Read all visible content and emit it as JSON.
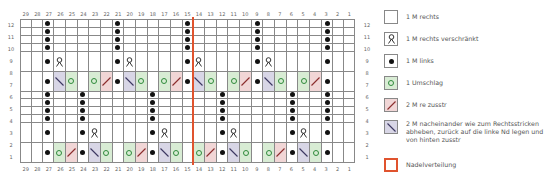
{
  "chart": {
    "columns": [
      29,
      28,
      27,
      26,
      25,
      24,
      23,
      22,
      21,
      20,
      19,
      18,
      17,
      16,
      15,
      14,
      13,
      12,
      11,
      10,
      9,
      8,
      7,
      6,
      5,
      4,
      3,
      2,
      1
    ],
    "rows": [
      12,
      11,
      10,
      9,
      8,
      7,
      6,
      5,
      4,
      3,
      2,
      1
    ],
    "needle_division_between_columns": [
      15,
      14
    ],
    "symbol_legend": {
      "k": "empty",
      "q": "twisted-knit",
      "p": "dot",
      "yo": "ring",
      "k2tog": "slash-right",
      "ssk": "slash-left"
    },
    "cells": {
      "12": {
        "27": "p",
        "21": "p",
        "15": "p",
        "9": "p",
        "3": "p"
      },
      "11": {
        "27": "p",
        "21": "p",
        "15": "p",
        "9": "p",
        "3": "p"
      },
      "10": {
        "27": "p",
        "21": "p",
        "15": "p",
        "9": "p",
        "3": "p"
      },
      "9": {
        "27": "p",
        "21": "p",
        "15": "p",
        "9": "p",
        "3": "p"
      },
      "8": {
        "27": "p",
        "26": "q",
        "21": "p",
        "20": "q",
        "15": "p",
        "14": "q",
        "9": "p",
        "8": "q",
        "3": "p"
      },
      "7": {
        "27": "p",
        "26": "ssk",
        "25": "yo",
        "23": "yo",
        "22": "k2tog",
        "21": "p",
        "20": "ssk",
        "19": "yo",
        "17": "yo",
        "16": "k2tog",
        "15": "p",
        "14": "ssk",
        "13": "yo",
        "11": "yo",
        "10": "k2tog",
        "9": "p",
        "8": "ssk",
        "7": "yo",
        "5": "yo",
        "4": "k2tog",
        "3": "p"
      },
      "6": {
        "27": "p",
        "24": "p",
        "18": "p",
        "12": "p",
        "6": "p",
        "3": "p"
      },
      "5": {
        "27": "p",
        "24": "p",
        "18": "p",
        "12": "p",
        "6": "p",
        "3": "p"
      },
      "4": {
        "27": "p",
        "24": "p",
        "18": "p",
        "12": "p",
        "6": "p",
        "3": "p"
      },
      "3": {
        "27": "p",
        "24": "p",
        "18": "p",
        "12": "p",
        "6": "p",
        "3": "p"
      },
      "2": {
        "27": "p",
        "24": "p",
        "23": "q",
        "18": "p",
        "17": "q",
        "12": "p",
        "11": "q",
        "6": "p",
        "5": "q",
        "3": "p"
      },
      "1": {
        "27": "p",
        "26": "yo",
        "25": "k2tog",
        "24": "p",
        "23": "ssk",
        "22": "yo",
        "20": "yo",
        "19": "k2tog",
        "18": "p",
        "17": "ssk",
        "16": "yo",
        "14": "yo",
        "13": "k2tog",
        "12": "p",
        "11": "ssk",
        "10": "yo",
        "8": "yo",
        "7": "k2tog",
        "6": "p",
        "5": "ssk",
        "4": "yo",
        "3": "p"
      }
    }
  },
  "colors": {
    "grid_line": "#888888",
    "yo_fill": "#d8ecd4",
    "k2tog_fill": "#f1d6d6",
    "ssk_fill": "#d8d6e6",
    "needle_division": "#e0532e",
    "purl_dot": "#111111"
  },
  "legend": {
    "items": [
      {
        "key": "k",
        "label": "1 M rechts"
      },
      {
        "key": "q",
        "label": "1 M rechts verschränkt"
      },
      {
        "key": "p",
        "label": "1 M links"
      },
      {
        "key": "yo",
        "label": "1 Umschlag"
      },
      {
        "key": "k2tog",
        "label": "2 M re zusstr"
      },
      {
        "key": "ssk",
        "label": "2 M nacheinander wie zum Rechtsstricken abheben, zurück auf die linke Nd legen und von hinten zusstr"
      },
      {
        "key": "needle",
        "label": "Nadelverteilung"
      }
    ]
  }
}
